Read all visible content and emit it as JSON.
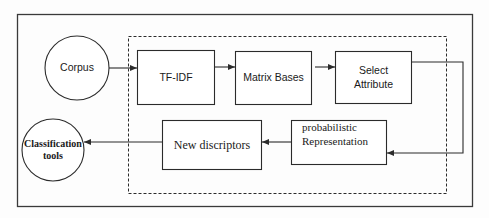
{
  "diagram": {
    "type": "flowchart",
    "colors": {
      "stroke": "#2b2b2b",
      "text": "#1a1a1a",
      "background": "#fdfdfd"
    },
    "nodes": {
      "corpus": {
        "label": "Corpus",
        "shape": "circle"
      },
      "tfidf": {
        "label": "TF-IDF",
        "shape": "rectangle"
      },
      "matrix_bases": {
        "label": "Matrix Bases",
        "shape": "rectangle"
      },
      "select_attribute": {
        "label_line1": "Select",
        "label_line2": "Attribute",
        "shape": "rectangle"
      },
      "probabilistic": {
        "label_line1": "probabilistic",
        "label_line2": "Representation",
        "shape": "rectangle"
      },
      "new_discriptors": {
        "label": "New discriptors",
        "shape": "rectangle"
      },
      "classification": {
        "label_line1": "Classification",
        "label_line2": "tools",
        "shape": "circle"
      }
    },
    "edges": [
      {
        "from": "Corpus",
        "to": "TF-IDF"
      },
      {
        "from": "TF-IDF",
        "to": "Matrix Bases"
      },
      {
        "from": "Matrix Bases",
        "to": "Select Attribute"
      },
      {
        "from": "Select Attribute",
        "to": "probabilistic Representation"
      },
      {
        "from": "probabilistic Representation",
        "to": "New discriptors"
      },
      {
        "from": "New discriptors",
        "to": "Classification tools"
      }
    ],
    "groups": [
      {
        "name": "processing-pipeline",
        "style": "dashed",
        "contains": [
          "TF-IDF",
          "Matrix Bases",
          "Select Attribute",
          "probabilistic Representation",
          "New discriptors"
        ]
      }
    ]
  }
}
